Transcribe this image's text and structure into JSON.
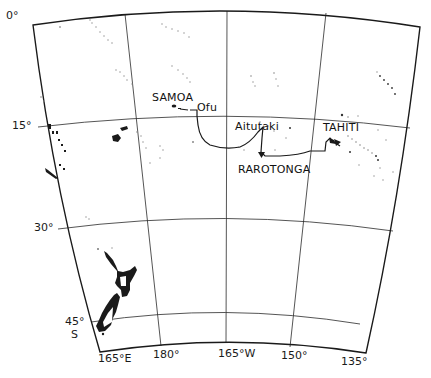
{
  "map": {
    "type": "route-map",
    "region": "South Pacific",
    "colors": {
      "ink": "#1a1a1a",
      "background": "#ffffff",
      "island_dots": "#8a8a8a"
    },
    "latitude_labels": [
      {
        "id": "lat-0",
        "text": "0°"
      },
      {
        "id": "lat-15",
        "text": "15°"
      },
      {
        "id": "lat-30",
        "text": "30°"
      },
      {
        "id": "lat-45",
        "text": "45°"
      },
      {
        "id": "lat-s",
        "text": "S"
      }
    ],
    "longitude_labels": [
      {
        "id": "lon-165e",
        "text": "165°E"
      },
      {
        "id": "lon-180",
        "text": "180°"
      },
      {
        "id": "lon-165w",
        "text": "165°W"
      },
      {
        "id": "lon-150",
        "text": "150°"
      },
      {
        "id": "lon-135",
        "text": "135°"
      }
    ],
    "places": [
      {
        "id": "samoa",
        "text": "SAMOA"
      },
      {
        "id": "ofu",
        "text": "Ofu"
      },
      {
        "id": "aitutaki",
        "text": "Aitutaki"
      },
      {
        "id": "tahiti",
        "text": "TAHITI"
      },
      {
        "id": "rarotonga",
        "text": "RAROTONGA"
      }
    ],
    "route": {
      "description": "Voyage track from Ofu (Samoa) via Aitutaki and Rarotonga to Tahiti",
      "stops": [
        "Ofu",
        "Aitutaki",
        "Rarotonga",
        "Tahiti"
      ]
    }
  }
}
